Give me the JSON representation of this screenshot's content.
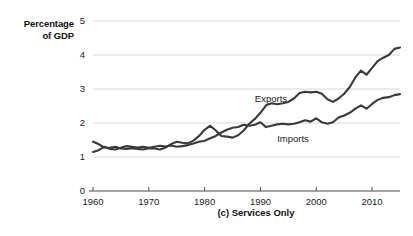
{
  "chart_data": {
    "type": "line",
    "title": "",
    "caption": "(c) Services Only",
    "ylabel": "Percentage\nof GDP",
    "ylabel_line1": "Percentage",
    "ylabel_line2": "of GDP",
    "xlabel": "",
    "xlim": [
      1960,
      2015
    ],
    "ylim": [
      0,
      5
    ],
    "yticks": [
      0,
      1,
      2,
      3,
      4,
      5
    ],
    "xticks": [
      1960,
      1970,
      1980,
      1990,
      2000,
      2010
    ],
    "grid": "horizontal",
    "legend_position": "inline-annotations",
    "line_color": "#3a3a3a",
    "grid_color": "#d8d8d8",
    "axis_color": "#4a4a4a",
    "x": [
      1960,
      1961,
      1962,
      1963,
      1964,
      1965,
      1966,
      1967,
      1968,
      1969,
      1970,
      1971,
      1972,
      1973,
      1974,
      1975,
      1976,
      1977,
      1978,
      1979,
      1980,
      1981,
      1982,
      1983,
      1984,
      1985,
      1986,
      1987,
      1988,
      1989,
      1990,
      1991,
      1992,
      1993,
      1994,
      1995,
      1996,
      1997,
      1998,
      1999,
      2000,
      2001,
      2002,
      2003,
      2004,
      2005,
      2006,
      2007,
      2008,
      2009,
      2010,
      2011,
      2012,
      2013,
      2014,
      2015
    ],
    "series": [
      {
        "name": "Exports",
        "label_x": 1989,
        "label_y": 2.72,
        "values": [
          1.45,
          1.38,
          1.28,
          1.27,
          1.3,
          1.25,
          1.24,
          1.26,
          1.24,
          1.22,
          1.26,
          1.25,
          1.22,
          1.28,
          1.38,
          1.45,
          1.42,
          1.4,
          1.48,
          1.62,
          1.8,
          1.92,
          1.78,
          1.62,
          1.6,
          1.57,
          1.64,
          1.78,
          1.98,
          2.12,
          2.3,
          2.52,
          2.58,
          2.55,
          2.58,
          2.62,
          2.72,
          2.88,
          2.92,
          2.9,
          2.92,
          2.86,
          2.7,
          2.62,
          2.72,
          2.86,
          3.06,
          3.34,
          3.54,
          3.42,
          3.62,
          3.82,
          3.92,
          4.0,
          4.18,
          4.22
        ]
      },
      {
        "name": "Imports",
        "label_x": 1993,
        "label_y": 1.52,
        "values": [
          1.15,
          1.2,
          1.3,
          1.24,
          1.22,
          1.27,
          1.32,
          1.3,
          1.28,
          1.3,
          1.27,
          1.3,
          1.33,
          1.31,
          1.34,
          1.3,
          1.32,
          1.35,
          1.4,
          1.45,
          1.48,
          1.55,
          1.62,
          1.72,
          1.8,
          1.86,
          1.88,
          1.95,
          1.92,
          1.95,
          2.02,
          1.88,
          1.92,
          1.96,
          1.98,
          1.96,
          1.98,
          2.02,
          2.08,
          2.04,
          2.14,
          2.02,
          1.98,
          2.02,
          2.16,
          2.22,
          2.3,
          2.42,
          2.52,
          2.42,
          2.56,
          2.68,
          2.74,
          2.76,
          2.82,
          2.85
        ]
      }
    ]
  }
}
